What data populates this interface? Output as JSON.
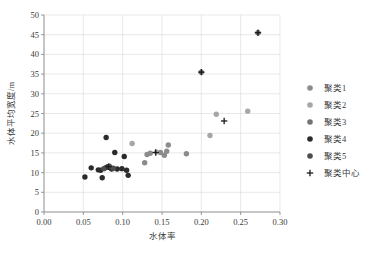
{
  "chart_data": {
    "type": "scatter",
    "title": "",
    "xlabel": "水体率",
    "ylabel": "水体平均宽度/m",
    "xlim": [
      0.0,
      0.3
    ],
    "ylim": [
      0,
      50
    ],
    "xticks": [
      "0.00",
      "0.05",
      "0.10",
      "0.15",
      "0.20",
      "0.25",
      "0.30"
    ],
    "xtick_values": [
      0.0,
      0.05,
      0.1,
      0.15,
      0.2,
      0.25,
      0.3
    ],
    "yticks": [
      "0",
      "5",
      "10",
      "15",
      "20",
      "25",
      "30",
      "35",
      "40",
      "45",
      "50"
    ],
    "ytick_values": [
      0,
      5,
      10,
      15,
      20,
      25,
      30,
      35,
      40,
      45,
      50
    ],
    "grid": "both",
    "legend_position": "right",
    "series": [
      {
        "name": "聚类1",
        "marker": "circle",
        "color": "#8c8c8c",
        "points": [
          [
            0.128,
            12.5
          ],
          [
            0.131,
            14.6
          ],
          [
            0.135,
            14.9
          ],
          [
            0.148,
            15.1
          ],
          [
            0.153,
            14.4
          ],
          [
            0.156,
            15.4
          ],
          [
            0.158,
            17.0
          ],
          [
            0.181,
            14.8
          ]
        ]
      },
      {
        "name": "聚类2",
        "marker": "circle",
        "color": "#a6a6a6",
        "points": [
          [
            0.112,
            17.4
          ],
          [
            0.143,
            15.2
          ],
          [
            0.211,
            19.4
          ],
          [
            0.219,
            24.8
          ],
          [
            0.259,
            25.6
          ]
        ]
      },
      {
        "name": "聚类3",
        "marker": "circle",
        "color": "#737373",
        "points": [
          [
            0.2,
            35.5
          ],
          [
            0.272,
            45.5
          ]
        ]
      },
      {
        "name": "聚类4",
        "marker": "circle",
        "color": "#2b2b2b",
        "points": [
          [
            0.052,
            8.9
          ],
          [
            0.06,
            11.2
          ],
          [
            0.069,
            10.7
          ],
          [
            0.072,
            10.6
          ],
          [
            0.074,
            8.7
          ],
          [
            0.078,
            11.2
          ],
          [
            0.079,
            18.9
          ],
          [
            0.081,
            11.5
          ],
          [
            0.084,
            11.3
          ],
          [
            0.086,
            10.9
          ],
          [
            0.09,
            15.1
          ],
          [
            0.093,
            10.9
          ],
          [
            0.099,
            11.0
          ],
          [
            0.102,
            14.1
          ],
          [
            0.105,
            10.6
          ],
          [
            0.107,
            9.3
          ]
        ]
      },
      {
        "name": "聚类5",
        "marker": "circle",
        "color": "#4d4d4d",
        "points": [
          [
            0.076,
            11.0
          ],
          [
            0.083,
            11.6
          ],
          [
            0.088,
            11.1
          ]
        ]
      },
      {
        "name": "聚类中心",
        "marker": "plus",
        "color": "#1a1a1a",
        "points": [
          [
            0.082,
            11.5
          ],
          [
            0.142,
            15.1
          ],
          [
            0.229,
            23.1
          ],
          [
            0.2,
            35.5
          ],
          [
            0.272,
            45.5
          ]
        ]
      }
    ]
  },
  "legend": {
    "items": [
      {
        "label": "聚类1",
        "marker": "circle",
        "color": "#8c8c8c"
      },
      {
        "label": "聚类2",
        "marker": "circle",
        "color": "#a6a6a6"
      },
      {
        "label": "聚类3",
        "marker": "circle",
        "color": "#737373"
      },
      {
        "label": "聚类4",
        "marker": "circle",
        "color": "#2b2b2b"
      },
      {
        "label": "聚类5",
        "marker": "circle",
        "color": "#4d4d4d"
      },
      {
        "label": "聚类中心",
        "marker": "plus",
        "color": "#1a1a1a"
      }
    ]
  },
  "style": {
    "grid_color": "#d9d9d9",
    "axis_color": "#808080",
    "text_color": "#3a3a3a",
    "background": "#ffffff"
  }
}
